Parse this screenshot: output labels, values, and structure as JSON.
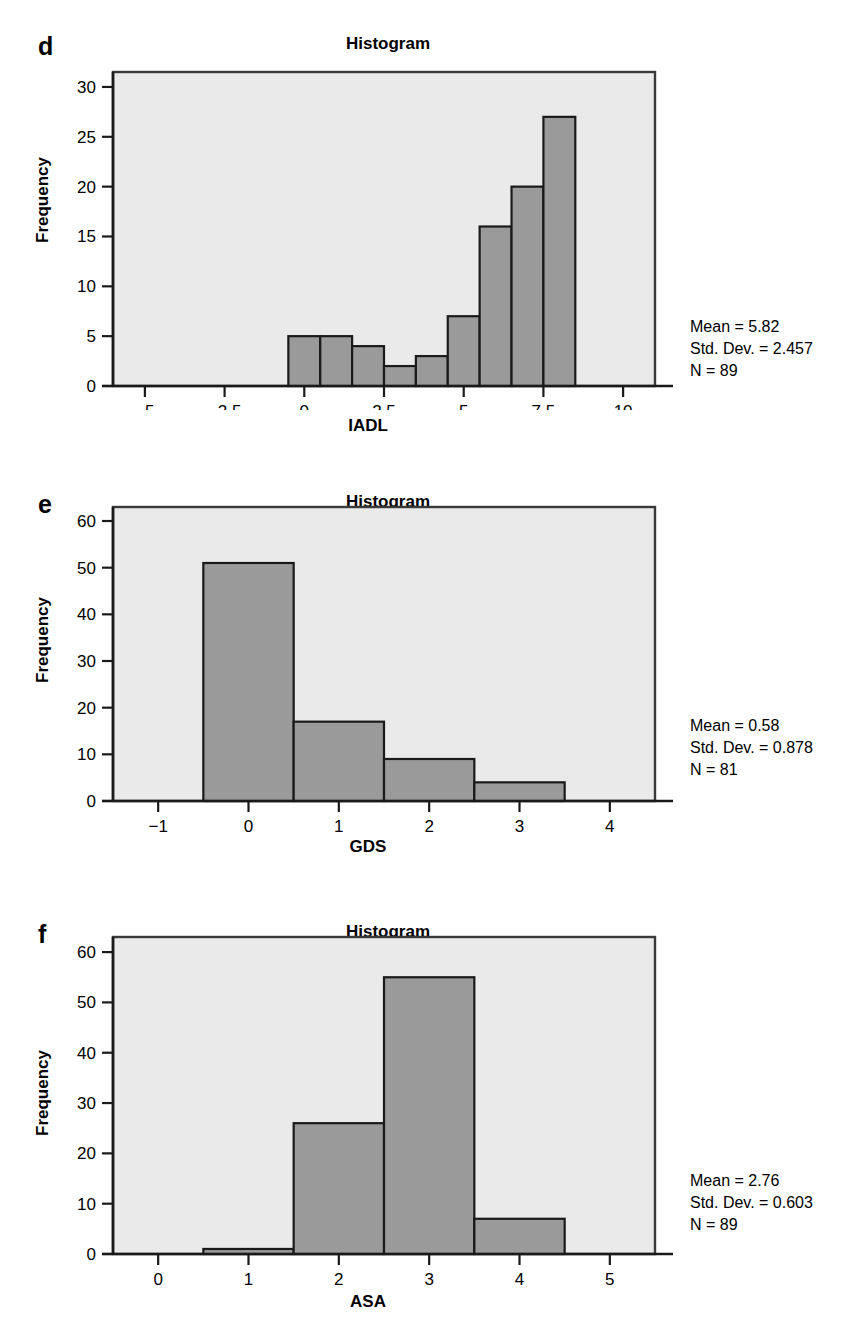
{
  "figure": {
    "background_color": "#ffffff",
    "bar_fill_color": "#9a9a9a",
    "bar_stroke_color": "#1a1a1a",
    "plot_background_color": "#eaeaea",
    "axis_color": "#1a1a1a"
  },
  "panels": [
    {
      "label": "d",
      "title": "Histogram",
      "xlabel": "IADL",
      "ylabel": "Frequency",
      "stats": {
        "mean": "Mean = 5.82",
        "std_dev": "Std. Dev. = 2.457",
        "n": "N = 89"
      }
    },
    {
      "label": "e",
      "title": "Histogram",
      "xlabel": "GDS",
      "ylabel": "Frequency",
      "stats": {
        "mean": "Mean = 0.58",
        "std_dev": "Std. Dev. = 0.878",
        "n": "N = 81"
      }
    },
    {
      "label": "f",
      "title": "Histogram",
      "xlabel": "ASA",
      "ylabel": "Frequency",
      "stats": {
        "mean": "Mean = 2.76",
        "std_dev": "Std. Dev. = 0.603",
        "n": "N = 89"
      }
    }
  ],
  "chart_data": [
    {
      "type": "bar",
      "panel": "d",
      "title": "Histogram",
      "xlabel": "IADL",
      "ylabel": "Frequency",
      "grid": false,
      "legend": "none",
      "xlim": [
        -6.0,
        11.0
      ],
      "ylim": [
        0,
        31.5
      ],
      "xticks": [
        -5,
        -2.5,
        0,
        2.5,
        5,
        7.5,
        10
      ],
      "xtick_labels": [
        "−5",
        "−2.5",
        "0",
        "2.5",
        "5",
        "7.5",
        "10"
      ],
      "yticks": [
        0,
        5,
        10,
        15,
        20,
        25,
        30
      ],
      "ytick_labels": [
        "0",
        "5",
        "10",
        "15",
        "20",
        "25",
        "30"
      ],
      "bin_width": 1,
      "bin_edges": [
        -0.5,
        0.5,
        1.5,
        2.5,
        3.5,
        4.5,
        5.5,
        6.5,
        7.5,
        8.5
      ],
      "bin_centers": [
        0,
        1,
        2,
        3,
        4,
        5,
        6,
        7,
        8
      ],
      "values": [
        5,
        5,
        4,
        2,
        3,
        7,
        16,
        20,
        27
      ],
      "mean": 5.82,
      "std_dev": 2.457,
      "n": 89,
      "annotations": [
        "Mean = 5.82",
        "Std. Dev. = 2.457",
        "N = 89"
      ]
    },
    {
      "type": "bar",
      "panel": "e",
      "title": "Histogram",
      "xlabel": "GDS",
      "ylabel": "Frequency",
      "grid": false,
      "legend": "none",
      "xlim": [
        -1.5,
        4.5
      ],
      "ylim": [
        0,
        63
      ],
      "xticks": [
        -1,
        0,
        1,
        2,
        3,
        4
      ],
      "xtick_labels": [
        "−1",
        "0",
        "1",
        "2",
        "3",
        "4"
      ],
      "yticks": [
        0,
        10,
        20,
        30,
        40,
        50,
        60
      ],
      "ytick_labels": [
        "0",
        "10",
        "20",
        "30",
        "40",
        "50",
        "60"
      ],
      "bin_width": 1,
      "bin_edges": [
        -0.5,
        0.5,
        1.5,
        2.5,
        3.5
      ],
      "bin_centers": [
        0,
        1,
        2,
        3
      ],
      "values": [
        51,
        17,
        9,
        4
      ],
      "mean": 0.58,
      "std_dev": 0.878,
      "n": 81,
      "annotations": [
        "Mean = 0.58",
        "Std. Dev. = 0.878",
        "N = 81"
      ]
    },
    {
      "type": "bar",
      "panel": "f",
      "title": "Histogram",
      "xlabel": "ASA",
      "ylabel": "Frequency",
      "grid": false,
      "legend": "none",
      "xlim": [
        -0.5,
        5.5
      ],
      "ylim": [
        0,
        63
      ],
      "xticks": [
        0,
        1,
        2,
        3,
        4,
        5
      ],
      "xtick_labels": [
        "0",
        "1",
        "2",
        "3",
        "4",
        "5"
      ],
      "yticks": [
        0,
        10,
        20,
        30,
        40,
        50,
        60
      ],
      "ytick_labels": [
        "0",
        "10",
        "20",
        "30",
        "40",
        "50",
        "60"
      ],
      "bin_width": 1,
      "bin_edges": [
        0.5,
        1.5,
        2.5,
        3.5,
        4.5
      ],
      "bin_centers": [
        1,
        2,
        3,
        4
      ],
      "values": [
        1,
        26,
        55,
        7
      ],
      "mean": 2.76,
      "std_dev": 0.603,
      "n": 89,
      "annotations": [
        "Mean = 2.76",
        "Std. Dev. = 0.603",
        "N = 89"
      ]
    }
  ]
}
